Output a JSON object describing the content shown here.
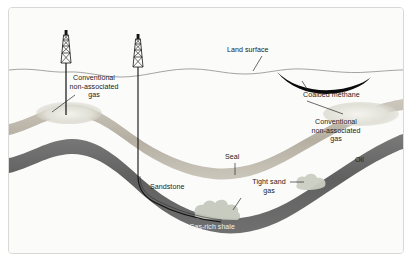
{
  "figure": {
    "background_color": "#fbfbfa",
    "border_color": "#d8d8d6"
  },
  "labels": {
    "land_surface": "Land surface",
    "coalbed_methane": "Coalbed methane",
    "conventional_left_line1": "Conventional",
    "conventional_left_line2": "non-associated",
    "conventional_left_line3": "gas",
    "conventional_right_line1": "Conventional",
    "conventional_right_line2": "non-associated",
    "conventional_right_line3": "gas",
    "oil": "Oil",
    "seal": "Seal",
    "sandstone": "Sandstone",
    "tight_sand_line1": "Tight sand",
    "tight_sand_line2": "gas",
    "gas_rich_shale": "Gas-rich shale"
  },
  "colors": {
    "seal_band": "#b9b3a6",
    "seal_band_light": "#cfcac0",
    "shale_band": "#6e6e6e",
    "shale_band_dark": "#5d5d5d",
    "coal_seam": "#0a0a0a",
    "gas_cloud": "#c9cdc2",
    "gas_pocket": "#e3e2da",
    "well_line": "#101010",
    "surface_line": "#9a9a96",
    "leader_line": "#2b2b2b",
    "shale_label_text": "#f2f2f0"
  },
  "features": {
    "derricks": [
      {
        "name": "derrick-left",
        "x": 57,
        "surface_y": 66
      },
      {
        "name": "derrick-right",
        "x": 129,
        "surface_y": 70
      }
    ],
    "wells": [
      {
        "name": "vertical-well",
        "type": "vertical",
        "target": "conventional gas anticline crest"
      },
      {
        "name": "horizontal-well",
        "type": "directional-horizontal",
        "target": "gas-rich shale"
      }
    ],
    "strata": [
      {
        "name": "seal",
        "kind": "band"
      },
      {
        "name": "sandstone",
        "kind": "matrix"
      },
      {
        "name": "gas-rich-shale",
        "kind": "band"
      },
      {
        "name": "coal-seam",
        "kind": "lens"
      }
    ],
    "accumulations": [
      {
        "name": "conventional-gas-anticline"
      },
      {
        "name": "conventional-gas-oil-right"
      },
      {
        "name": "tight-sand-gas-upper"
      },
      {
        "name": "tight-sand-gas-lower"
      },
      {
        "name": "coalbed-methane"
      }
    ]
  }
}
